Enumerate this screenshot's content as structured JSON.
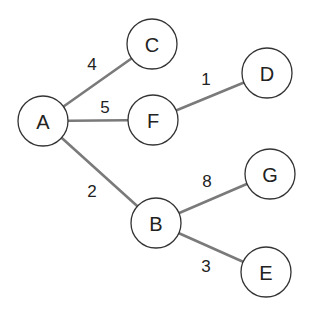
{
  "diagram": {
    "type": "weighted-graph",
    "node_radius": 25,
    "colors": {
      "edge": "#7a7a7a",
      "node_stroke": "#333333",
      "node_fill": "#ffffff",
      "text": "#222222"
    },
    "nodes": [
      {
        "id": "A",
        "label": "A",
        "x": 43,
        "y": 121
      },
      {
        "id": "C",
        "label": "C",
        "x": 152,
        "y": 44
      },
      {
        "id": "F",
        "label": "F",
        "x": 153,
        "y": 120
      },
      {
        "id": "D",
        "label": "D",
        "x": 267,
        "y": 73
      },
      {
        "id": "B",
        "label": "B",
        "x": 156,
        "y": 223
      },
      {
        "id": "G",
        "label": "G",
        "x": 270,
        "y": 174
      },
      {
        "id": "E",
        "label": "E",
        "x": 266,
        "y": 272
      }
    ],
    "edges": [
      {
        "from": "A",
        "to": "C",
        "weight": "4",
        "label_x": 92,
        "label_y": 64
      },
      {
        "from": "A",
        "to": "F",
        "weight": "5",
        "label_x": 105,
        "label_y": 107
      },
      {
        "from": "F",
        "to": "D",
        "weight": "1",
        "label_x": 206,
        "label_y": 79
      },
      {
        "from": "A",
        "to": "B",
        "weight": "2",
        "label_x": 92,
        "label_y": 191
      },
      {
        "from": "B",
        "to": "G",
        "weight": "8",
        "label_x": 207,
        "label_y": 181
      },
      {
        "from": "B",
        "to": "E",
        "weight": "3",
        "label_x": 206,
        "label_y": 266
      }
    ]
  }
}
